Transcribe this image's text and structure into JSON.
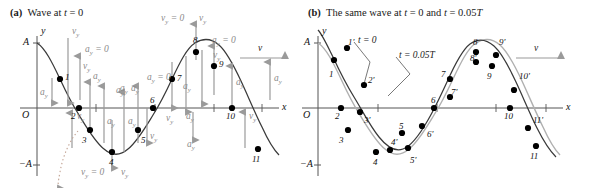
{
  "figure": {
    "title_a": "Wave at t = 0",
    "title_b": "The same wave at t = 0 and t = 0.05T",
    "label_a": "(a)",
    "label_b": "(b)",
    "colors": {
      "wave_dark": "#3a3a3a",
      "wave_light": "#b0b0b0",
      "arrow_gray": "#9a9a9a",
      "axis": "#555555",
      "point": "#000000",
      "text": "#1a1a1a"
    }
  },
  "panel_a": {
    "axes": {
      "x_label": "x",
      "y_label": "y",
      "origin_label": "O",
      "amp_pos_label": "A",
      "amp_neg_label": "−A"
    },
    "wave_speed_label": "v",
    "point_numbers": [
      "1",
      "2",
      "3",
      "4",
      "5",
      "6",
      "7",
      "8",
      "9",
      "10",
      "11"
    ],
    "vector_labels": {
      "vy": "v_y",
      "ay": "a_y",
      "vy_zero": "v_y = 0",
      "ay_zero": "a_y = 0"
    },
    "annotations": [
      {
        "id": "vy-top-1",
        "text": "v_y"
      },
      {
        "id": "ay-zero-1",
        "text": "a_y = 0"
      },
      {
        "id": "vy-1",
        "text": "v_y"
      },
      {
        "id": "ay-left",
        "text": "a_y"
      },
      {
        "id": "ay-2",
        "text": "a_y"
      },
      {
        "id": "vy-2",
        "text": "v_y"
      },
      {
        "id": "ay-3",
        "text": "a_y"
      },
      {
        "id": "ay-4",
        "text": "a_y"
      },
      {
        "id": "ay-5",
        "text": "a_y"
      },
      {
        "id": "ay-zero-6",
        "text": "a_y = 0"
      },
      {
        "id": "vy-5",
        "text": "v_y"
      },
      {
        "id": "vy-zero-4",
        "text": "v_y = 0"
      },
      {
        "id": "vy-4b",
        "text": "v_y"
      },
      {
        "id": "vy-7",
        "text": "v_y"
      },
      {
        "id": "ay-7",
        "text": "a_y"
      },
      {
        "id": "vy-zero-8",
        "text": "v_y = 0"
      },
      {
        "id": "vy-8",
        "text": "v_y"
      },
      {
        "id": "ay-8",
        "text": "a_y"
      },
      {
        "id": "ay-9",
        "text": "a_y"
      },
      {
        "id": "ay-zero-9",
        "text": "a_y = 0"
      },
      {
        "id": "vy-9",
        "text": "v_y"
      },
      {
        "id": "ay-10",
        "text": "a_y"
      },
      {
        "id": "ay-11",
        "text": "a_y"
      },
      {
        "id": "vy-10",
        "text": "v_y"
      },
      {
        "id": "vy-11",
        "text": "v_y"
      }
    ]
  },
  "panel_b": {
    "axes": {
      "x_label": "x",
      "y_label": "y",
      "origin_label": "O",
      "amp_pos_label": "A",
      "amp_neg_label": "−A"
    },
    "wave_speed_label": "v",
    "curve_labels": {
      "t0": "t = 0",
      "t005T": "t = 0.05T"
    },
    "point_numbers_t0": [
      "1",
      "2",
      "3",
      "4",
      "5",
      "6",
      "7",
      "8",
      "9",
      "10",
      "11"
    ],
    "point_numbers_t005T": [
      "1'",
      "2'",
      "3'",
      "4'",
      "5'",
      "6'",
      "7'",
      "8'",
      "9'",
      "10'",
      "11'"
    ]
  }
}
